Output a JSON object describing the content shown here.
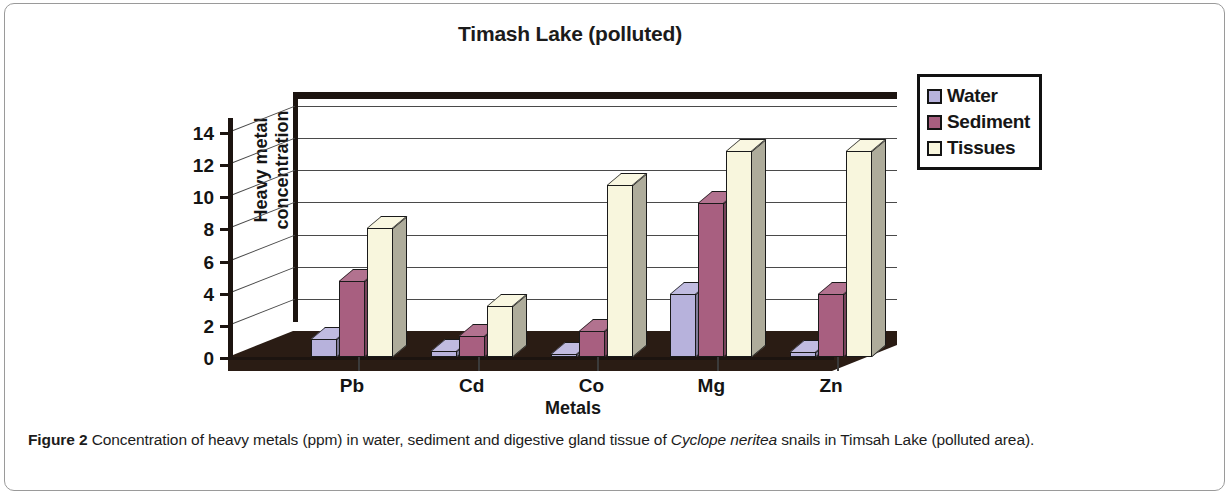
{
  "chart_data": {
    "type": "bar",
    "title": "Timash Lake (polluted)",
    "xlabel": "Metals",
    "ylabel": "Heavy metal concentration",
    "ylabel_line1": "Heavy metal",
    "ylabel_line2": "concentration",
    "categories": [
      "Pb",
      "Cd",
      "Co",
      "Mg",
      "Zn"
    ],
    "ylim": [
      0,
      14
    ],
    "yticks": [
      0,
      2,
      4,
      6,
      8,
      10,
      12,
      14
    ],
    "grid": true,
    "legend_position": "top-right",
    "three_d": true,
    "series": [
      {
        "name": "Water",
        "color": "#b7b2dc",
        "values": [
          1.1,
          0.35,
          0.2,
          3.9,
          0.3
        ]
      },
      {
        "name": "Sediment",
        "color": "#a85f80",
        "values": [
          4.7,
          1.3,
          1.6,
          9.6,
          3.9
        ]
      },
      {
        "name": "Tissues",
        "color": "#f8f6dd",
        "values": [
          8.0,
          3.2,
          10.7,
          12.8,
          12.8
        ]
      }
    ]
  },
  "legend": {
    "items": [
      {
        "label": "Water",
        "color": "#b7b2dc"
      },
      {
        "label": "Sediment",
        "color": "#a85f80"
      },
      {
        "label": "Tissues",
        "color": "#f8f6dd"
      }
    ]
  },
  "caption": {
    "label": "Figure 2",
    "text_before": " Concentration of heavy metals (ppm) in water, sediment and digestive gland tissue of ",
    "species": "Cyclope neritea",
    "text_after": " snails in Timsah Lake (polluted area)."
  }
}
